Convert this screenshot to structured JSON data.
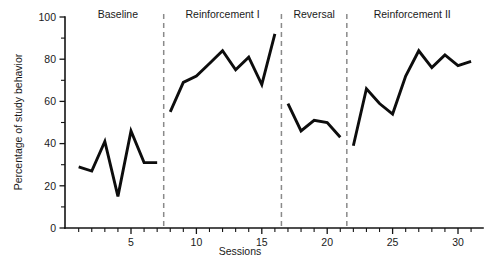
{
  "chart_data": {
    "type": "line",
    "title": "",
    "xlabel": "Sessions",
    "ylabel": "Percentage of study behavior",
    "xlim": [
      0,
      32
    ],
    "ylim": [
      0,
      100
    ],
    "grid": false,
    "legend": "none",
    "x_ticks_major": [
      5,
      10,
      15,
      20,
      25,
      30
    ],
    "x_tick_labels": [
      "5",
      "10",
      "15",
      "20",
      "25",
      "30"
    ],
    "y_ticks_major": [
      0,
      20,
      40,
      60,
      80,
      100
    ],
    "y_tick_labels": [
      "0",
      "20",
      "40",
      "60",
      "80",
      "100"
    ],
    "y_ticks_minor": [
      10,
      30,
      50,
      70,
      90
    ],
    "phases": [
      {
        "label": "Baseline",
        "start": 1,
        "end": 7,
        "divider_after": 7.5
      },
      {
        "label": "Reinforcement I",
        "start": 8,
        "end": 16,
        "divider_after": 16.5
      },
      {
        "label": "Reversal",
        "start": 17,
        "end": 21,
        "divider_after": 21.5
      },
      {
        "label": "Reinforcement II",
        "start": 22,
        "end": 31,
        "divider_after": null
      }
    ],
    "series": [
      {
        "name": "Percentage of study behavior",
        "color": "#0d0d0d",
        "segments": [
          {
            "phase": "Baseline",
            "x": [
              1,
              2,
              3,
              4,
              5,
              6,
              7
            ],
            "values": [
              29,
              27,
              41,
              15,
              46,
              31,
              31
            ]
          },
          {
            "phase": "Reinforcement I",
            "x": [
              8,
              9,
              10,
              11,
              12,
              13,
              14,
              15,
              16
            ],
            "values": [
              55,
              69,
              72,
              78,
              84,
              75,
              81,
              68,
              92
            ]
          },
          {
            "phase": "Reversal",
            "x": [
              17,
              18,
              19,
              20,
              21
            ],
            "values": [
              59,
              46,
              51,
              50,
              43
            ]
          },
          {
            "phase": "Reinforcement II",
            "x": [
              22,
              23,
              24,
              25,
              26,
              27,
              28,
              29,
              30,
              31
            ],
            "values": [
              39,
              66,
              59,
              54,
              72,
              84,
              76,
              82,
              77,
              79
            ]
          }
        ]
      }
    ]
  },
  "axes": {
    "y_title": "Percentage of study behavior",
    "x_title": "Sessions"
  }
}
